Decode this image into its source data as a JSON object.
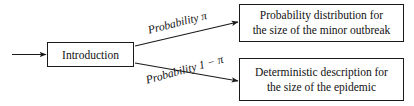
{
  "diagram": {
    "stroke_color": "#1a1a1a",
    "text_color": "#111111",
    "background_color": "#ffffff",
    "nodes": {
      "intro": {
        "label": "Introduction"
      },
      "outcome_minor": {
        "line1": "Probability distribution for",
        "line2": "the size of the minor outbreak"
      },
      "outcome_major": {
        "line1": "Deterministic description for",
        "line2": "the size of the epidemic"
      }
    },
    "edges": {
      "incoming": {
        "label": ""
      },
      "upper": {
        "label": "Probability π"
      },
      "lower": {
        "label": "Probability 1 − π"
      }
    }
  }
}
